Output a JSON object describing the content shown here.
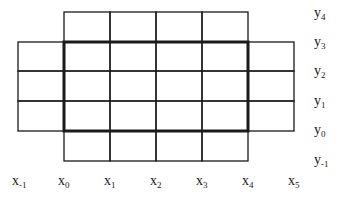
{
  "diagram": {
    "type": "grid-stencil",
    "x_lines": [
      18,
      64,
      110,
      156,
      202,
      248,
      294
    ],
    "y_lines": [
      12,
      42,
      71,
      101,
      131,
      161
    ],
    "colors": {
      "line": "#1a1a1a",
      "background": "#ffffff"
    },
    "highlight_rect": {
      "x0": 64,
      "y0": 42,
      "x1": 248,
      "y1": 131,
      "stroke_width": 3
    },
    "cell_rows": [
      {
        "y0": 12,
        "y1": 42,
        "x_from": 64,
        "x_to": 248
      },
      {
        "y0": 42,
        "y1": 71,
        "x_from": 18,
        "x_to": 294
      },
      {
        "y0": 71,
        "y1": 101,
        "x_from": 18,
        "x_to": 294
      },
      {
        "y0": 101,
        "y1": 131,
        "x_from": 18,
        "x_to": 294
      },
      {
        "y0": 131,
        "y1": 161,
        "x_from": 64,
        "x_to": 248
      }
    ]
  },
  "x_labels": [
    {
      "base": "x",
      "sub": "-1",
      "left": 12
    },
    {
      "base": "x",
      "sub": "0",
      "left": 58
    },
    {
      "base": "x",
      "sub": "1",
      "left": 104
    },
    {
      "base": "x",
      "sub": "2",
      "left": 150
    },
    {
      "base": "x",
      "sub": "3",
      "left": 196
    },
    {
      "base": "x",
      "sub": "4",
      "left": 242
    },
    {
      "base": "x",
      "sub": "5",
      "left": 288
    }
  ],
  "y_labels": [
    {
      "base": "y",
      "sub": "4",
      "top": 6
    },
    {
      "base": "y",
      "sub": "3",
      "top": 35
    },
    {
      "base": "y",
      "sub": "2",
      "top": 64
    },
    {
      "base": "y",
      "sub": "1",
      "top": 94
    },
    {
      "base": "y",
      "sub": "0",
      "top": 123
    },
    {
      "base": "y",
      "sub": "-1",
      "top": 153
    }
  ]
}
